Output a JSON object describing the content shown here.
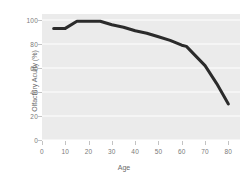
{
  "chart_data": {
    "type": "line",
    "title": "",
    "xlabel": "Age",
    "ylabel": "Olfactory Acuity (%)",
    "xlim": [
      0,
      85
    ],
    "ylim": [
      0,
      105
    ],
    "grid": "horizontal",
    "legend": "none",
    "line_color": "#2b2b2b",
    "plot_background": "#ebebeb",
    "gridline_color": "#ffffff",
    "x_ticks": [
      0,
      10,
      20,
      30,
      40,
      50,
      60,
      70,
      80
    ],
    "x_tick_labels": [
      "0",
      "10",
      "20",
      "30",
      "40",
      "50",
      "60",
      "70",
      "80"
    ],
    "y_ticks": [
      0,
      20,
      40,
      60,
      80,
      100
    ],
    "y_tick_labels": [
      "0",
      "20",
      "40",
      "60",
      "80",
      "100"
    ],
    "series": [
      {
        "name": "Olfactory Acuity",
        "x": [
          5,
          10,
          15,
          20,
          25,
          30,
          35,
          40,
          45,
          50,
          55,
          60,
          62,
          65,
          70,
          75,
          80
        ],
        "values": [
          93,
          93,
          99,
          99,
          99,
          96,
          94,
          91,
          89,
          86,
          83,
          79,
          78,
          72,
          62,
          47,
          30
        ]
      }
    ]
  },
  "axes": {
    "x_title": "Age",
    "y_title": "Olfactory Acuity (%)"
  }
}
